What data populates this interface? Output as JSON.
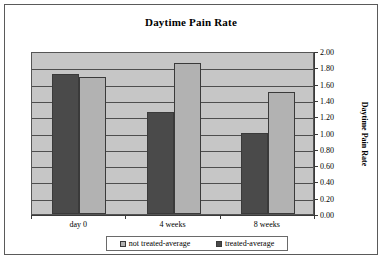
{
  "chart_data": {
    "type": "bar",
    "title": "Daytime Pain Rate",
    "xlabel": "",
    "ylabel": "Daytime Pain Rate",
    "categories": [
      "day 0",
      "4 weeks",
      "8 weeks"
    ],
    "series": [
      {
        "name": "not treated-average",
        "color": "#b2b2b2",
        "values": [
          1.68,
          1.85,
          1.5
        ]
      },
      {
        "name": "treated-average",
        "color": "#4a4a4a",
        "values": [
          1.72,
          1.25,
          1.0
        ]
      }
    ],
    "ylim": [
      0.0,
      2.0
    ],
    "ytick_step": 0.2,
    "yticks": [
      "0.00",
      "0.20",
      "0.40",
      "0.60",
      "0.80",
      "1.00",
      "1.20",
      "1.40",
      "1.60",
      "1.80",
      "2.00"
    ],
    "grid": true,
    "legend_position": "bottom",
    "plot_background": "#c6c6c6",
    "axis_color": "#3a3a3a"
  }
}
